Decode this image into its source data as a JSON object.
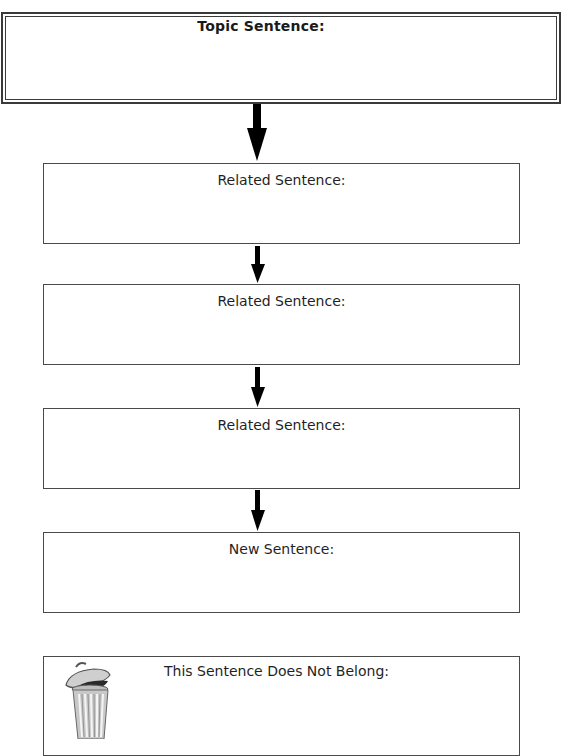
{
  "topic": {
    "label": "Topic Sentence:"
  },
  "boxes": [
    {
      "label": "Related Sentence:"
    },
    {
      "label": "Related Sentence:"
    },
    {
      "label": "Related Sentence:"
    },
    {
      "label": "New Sentence:"
    }
  ],
  "discard": {
    "label": "This Sentence Does Not Belong:",
    "icon": "trash-can-icon"
  },
  "colors": {
    "border": "#3a3a3a",
    "arrow": "#000000",
    "trash_fill": "#c8c8c8"
  }
}
